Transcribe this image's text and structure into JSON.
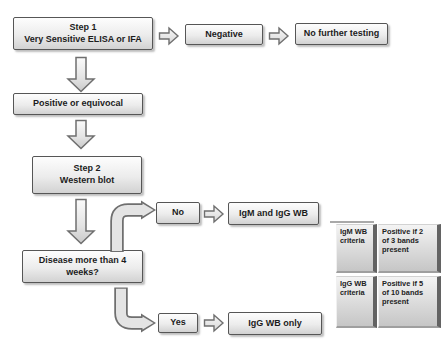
{
  "flowchart": {
    "nodes": {
      "step1": {
        "text": "Step 1\nVery Sensitive ELISA or IFA"
      },
      "negative": {
        "text": "Negative"
      },
      "no_further_testing": {
        "text": "No further testing"
      },
      "positive_or_equivocal": {
        "text": "Positive or equivocal"
      },
      "step2": {
        "text": "Step 2\nWestern blot"
      },
      "disease_duration": {
        "text": "Disease more than 4\nweeks?"
      },
      "no": {
        "text": "No"
      },
      "igm_and_igg_wb": {
        "text": "IgM and IgG WB"
      },
      "yes": {
        "text": "Yes"
      },
      "igg_wb_only": {
        "text": "IgG WB only"
      }
    },
    "icons": [
      "block-arrow-right-icon",
      "block-arrow-down-icon",
      "elbow-arrow-up-right-icon",
      "elbow-arrow-down-right-icon"
    ]
  },
  "criteria_table": {
    "cells": {
      "igm_label": "IgM WB\ncriteria",
      "igm_value": "Positive if 2\nof 3 bands\npresent",
      "igg_label": "IgG WB\ncriteria",
      "igg_value": "Positive if 5\nof 10 bands\npresent"
    }
  },
  "colors": {
    "background": "#ffffff",
    "node_border": "#565656",
    "node_fill_top": "#fdfdfd",
    "node_fill_bottom": "#d2d2d2",
    "text": "#1c1c1c",
    "arrow_outline": "#6f6f6f",
    "arrow_fill": "#e6e6e6",
    "tile_edge": "#636363"
  }
}
